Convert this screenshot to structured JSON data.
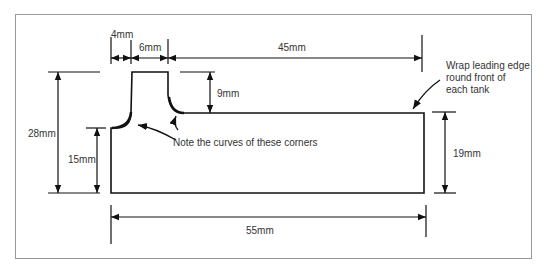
{
  "diagram": {
    "type": "technical-drawing",
    "colors": {
      "line": "#111111",
      "frame": "#999999",
      "text": "#333333",
      "background": "#ffffff"
    },
    "dimensions": {
      "tab_offset": "4mm",
      "tab_width": "6mm",
      "top_length": "45mm",
      "tab_height": "9mm",
      "overall_height": "28mm",
      "left_height": "15mm",
      "right_height": "19mm",
      "overall_length": "55mm"
    },
    "notes": {
      "curves": "Note the curves of these corners",
      "wrap_line1": "Wrap leading edge",
      "wrap_line2": "round front of",
      "wrap_line3": "each tank"
    }
  }
}
